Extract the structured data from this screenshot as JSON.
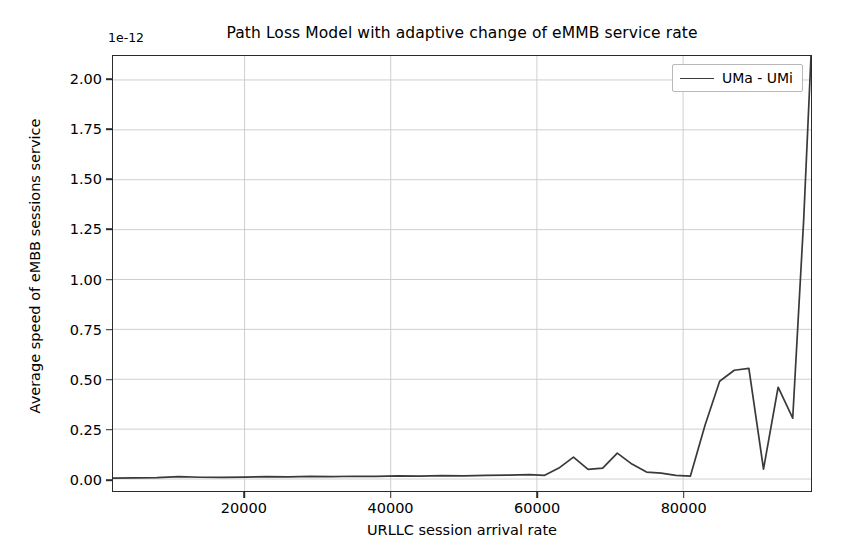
{
  "chart_data": {
    "type": "line",
    "title": "Path Loss Model with adaptive change of eMMB service rate",
    "xlabel": "URLLC session arrival rate",
    "ylabel": "Average speed of eMBB sessions service",
    "offset_text": "1e-12",
    "grid": true,
    "legend_position": "upper right",
    "xlim": [
      2000,
      97500
    ],
    "ylim": [
      -0.06,
      2.12
    ],
    "xticks": [
      20000,
      40000,
      60000,
      80000
    ],
    "xtick_labels": [
      "20000",
      "40000",
      "60000",
      "80000"
    ],
    "yticks": [
      0.0,
      0.25,
      0.5,
      0.75,
      1.0,
      1.25,
      1.5,
      1.75,
      2.0
    ],
    "ytick_labels": [
      "0.00",
      "0.25",
      "0.50",
      "0.75",
      "1.00",
      "1.25",
      "1.50",
      "1.75",
      "2.00"
    ],
    "series": [
      {
        "name": "UMa - UMi",
        "color": "#3a3a3a",
        "x": [
          2000,
          5000,
          8000,
          11000,
          14000,
          17000,
          20000,
          23000,
          26000,
          29000,
          32000,
          35000,
          38000,
          41000,
          44000,
          47000,
          50000,
          53000,
          56000,
          59000,
          61000,
          63000,
          65000,
          67000,
          69000,
          71000,
          73000,
          75000,
          77000,
          79000,
          81000,
          83000,
          85000,
          87000,
          89000,
          91000,
          93000,
          95000,
          96500,
          97500
        ],
        "y": [
          0.005,
          0.006,
          0.007,
          0.012,
          0.009,
          0.008,
          0.01,
          0.012,
          0.011,
          0.013,
          0.012,
          0.014,
          0.013,
          0.016,
          0.015,
          0.017,
          0.016,
          0.018,
          0.02,
          0.022,
          0.018,
          0.055,
          0.11,
          0.048,
          0.055,
          0.13,
          0.075,
          0.035,
          0.03,
          0.018,
          0.015,
          0.27,
          0.49,
          0.545,
          0.555,
          0.05,
          0.46,
          0.305,
          1.3,
          2.12
        ]
      }
    ]
  },
  "legend": {
    "entries": [
      {
        "label": "UMa - UMi",
        "swatch": "line-swatch"
      }
    ]
  }
}
